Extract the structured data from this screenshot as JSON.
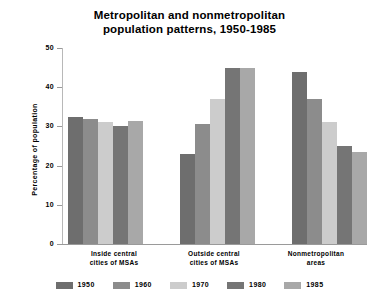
{
  "chart_data": {
    "type": "bar",
    "title": "Metropolitan and nonmetropolitan population patterns, 1950-1985",
    "title_lines": [
      "Metropolitan and nonmetropolitan",
      "population patterns, 1950-1985"
    ],
    "xlabel": "",
    "ylabel": "Percentage of population",
    "ylim": [
      0,
      50
    ],
    "yticks": [
      0,
      10,
      20,
      30,
      40,
      50
    ],
    "ytick_labels": [
      "0",
      "10",
      "20",
      "30",
      "40",
      "50"
    ],
    "grid": false,
    "legend_position": "bottom",
    "categories": [
      "Inside central cities of MSAs",
      "Outside central cities of MSAs",
      "Nonmetropolitan areas"
    ],
    "category_label_lines": [
      [
        "Inside central",
        "cities of MSAs"
      ],
      [
        "Outside central",
        "cities of MSAs"
      ],
      [
        "Nonmetropolitan",
        "areas"
      ]
    ],
    "series": [
      {
        "name": "1950",
        "color": "#6e6e6e",
        "values": [
          32.5,
          23.0,
          44.0
        ]
      },
      {
        "name": "1960",
        "color": "#8c8c8c",
        "values": [
          32.0,
          30.5,
          37.0
        ]
      },
      {
        "name": "1970",
        "color": "#cccccc",
        "values": [
          31.0,
          37.0,
          31.0
        ]
      },
      {
        "name": "1980",
        "color": "#757575",
        "values": [
          30.0,
          45.0,
          25.0
        ]
      },
      {
        "name": "1985",
        "color": "#a8a8a8",
        "values": [
          31.5,
          45.0,
          23.5
        ]
      }
    ]
  },
  "legend": {
    "items": [
      {
        "label": "1950",
        "color": "#6e6e6e"
      },
      {
        "label": "1960",
        "color": "#8c8c8c"
      },
      {
        "label": "1970",
        "color": "#cccccc"
      },
      {
        "label": "1980",
        "color": "#757575"
      },
      {
        "label": "1985",
        "color": "#a8a8a8"
      }
    ]
  },
  "axes": {
    "y_title": "Percentage of population",
    "y_tick_labels": [
      "50",
      "40",
      "30",
      "20",
      "10",
      "0"
    ]
  }
}
